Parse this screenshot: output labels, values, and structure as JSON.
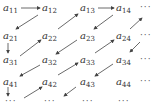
{
  "diagram": {
    "entries": [
      {
        "id": "a11",
        "base": "a",
        "sub": "11",
        "x": 3,
        "y": 3
      },
      {
        "id": "a12",
        "base": "a",
        "sub": "12",
        "x": 42,
        "y": 3
      },
      {
        "id": "a13",
        "base": "a",
        "sub": "13",
        "x": 80,
        "y": 3
      },
      {
        "id": "a14",
        "base": "a",
        "sub": "14",
        "x": 116,
        "y": 3
      },
      {
        "id": "a21",
        "base": "a",
        "sub": "21",
        "x": 3,
        "y": 31
      },
      {
        "id": "a22",
        "base": "a",
        "sub": "22",
        "x": 42,
        "y": 31
      },
      {
        "id": "a23",
        "base": "a",
        "sub": "23",
        "x": 80,
        "y": 31
      },
      {
        "id": "a24",
        "base": "a",
        "sub": "24",
        "x": 116,
        "y": 31
      },
      {
        "id": "a31",
        "base": "a",
        "sub": "31",
        "x": 3,
        "y": 55
      },
      {
        "id": "a32",
        "base": "a",
        "sub": "32",
        "x": 42,
        "y": 55
      },
      {
        "id": "a33",
        "base": "a",
        "sub": "33",
        "x": 80,
        "y": 55
      },
      {
        "id": "a34",
        "base": "a",
        "sub": "34",
        "x": 116,
        "y": 55
      },
      {
        "id": "a41",
        "base": "a",
        "sub": "41",
        "x": 3,
        "y": 77
      },
      {
        "id": "a42",
        "base": "a",
        "sub": "42",
        "x": 42,
        "y": 77
      },
      {
        "id": "a43",
        "base": "a",
        "sub": "43",
        "x": 80,
        "y": 77
      },
      {
        "id": "a44",
        "base": "a",
        "sub": "44",
        "x": 116,
        "y": 77
      }
    ],
    "ellipses": [
      {
        "text": "···",
        "x": 140,
        "y": 3
      },
      {
        "text": "···",
        "x": 140,
        "y": 31
      },
      {
        "text": "···",
        "x": 140,
        "y": 55
      },
      {
        "text": "···",
        "x": 140,
        "y": 77
      },
      {
        "text": "···",
        "x": 8,
        "y": 98
      },
      {
        "text": "···",
        "x": 46,
        "y": 98
      },
      {
        "text": "···",
        "x": 84,
        "y": 98
      },
      {
        "text": "···",
        "x": 120,
        "y": 98
      }
    ],
    "arrows": [
      {
        "from": "a11",
        "to": "a12",
        "dir": "right"
      },
      {
        "from": "a12",
        "to": "a21",
        "dir": "down-left"
      },
      {
        "from": "a21",
        "to": "a31",
        "dir": "down"
      },
      {
        "from": "a31",
        "to": "a22",
        "dir": "up-right"
      },
      {
        "from": "a22",
        "to": "a13",
        "dir": "up-right"
      },
      {
        "from": "a13",
        "to": "a14",
        "dir": "right"
      },
      {
        "from": "a14",
        "to": "a23",
        "dir": "down-left"
      },
      {
        "from": "a23",
        "to": "a32",
        "dir": "down-left"
      },
      {
        "from": "a32",
        "to": "a41",
        "dir": "down-left"
      },
      {
        "from": "a41",
        "to": "row5-col1",
        "dir": "down"
      },
      {
        "from": "row5-col1",
        "to": "a42",
        "dir": "up-right"
      },
      {
        "from": "a42",
        "to": "a33",
        "dir": "up-right"
      },
      {
        "from": "a33",
        "to": "a24",
        "dir": "up-right"
      },
      {
        "from": "a24",
        "to": "row1-col5",
        "dir": "up-right"
      },
      {
        "from": "row2-col5",
        "to": "a34",
        "dir": "down-left"
      },
      {
        "from": "a34",
        "to": "a43",
        "dir": "down-left"
      },
      {
        "from": "a43",
        "to": "row5-col2",
        "dir": "down-left"
      }
    ]
  }
}
